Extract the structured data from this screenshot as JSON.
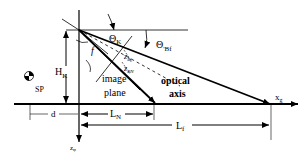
{
  "diagram": {
    "labels": {
      "theta_k": "Θ",
      "theta_k_sub": "K",
      "theta_bf": "Θ",
      "theta_bf_sub": "'Bf",
      "h_k": "H",
      "h_k_sub": "K",
      "f": "f",
      "z_bf": "z",
      "z_bf_sub": "Bf",
      "z_bn": "z",
      "z_bn_sub": "BN",
      "image_plane_1": "image",
      "image_plane_2": "plane",
      "optical_axis_1": "optical",
      "optical_axis_2": "axis",
      "sp": "SP",
      "d": "d",
      "l_n": "L",
      "l_n_sub": "N",
      "l_f": "L",
      "l_f_sub": "f",
      "x_g": "x",
      "x_g_sub": "g",
      "z_g": "z",
      "z_g_sub": "φ"
    }
  }
}
